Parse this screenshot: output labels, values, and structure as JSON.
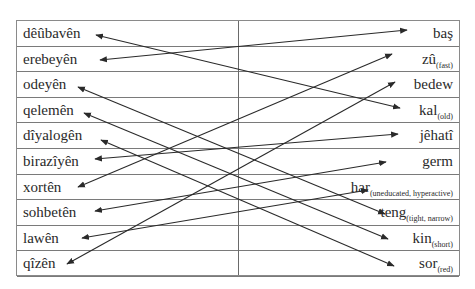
{
  "exercise": {
    "left_column": [
      {
        "word": "dêûbavên"
      },
      {
        "word": "erebeyên"
      },
      {
        "word": "odeyên"
      },
      {
        "word": "qelemên"
      },
      {
        "word": "dîyalogên"
      },
      {
        "word": "birazîyên"
      },
      {
        "word": "xortên"
      },
      {
        "word": "sohbetên"
      },
      {
        "word": "lawên"
      },
      {
        "word": "qîzên"
      }
    ],
    "right_column": [
      {
        "word": "baş",
        "gloss": ""
      },
      {
        "word": "zû",
        "gloss": "(fast)"
      },
      {
        "word": "bedew",
        "gloss": ""
      },
      {
        "word": "kal",
        "gloss": "(old)"
      },
      {
        "word": "jêhatî",
        "gloss": ""
      },
      {
        "word": "germ",
        "gloss": ""
      },
      {
        "word": "har",
        "gloss": "(uneducated, hyperactive)"
      },
      {
        "word": "teng",
        "gloss": "(tight, narrow)"
      },
      {
        "word": "kin",
        "gloss": "(short)"
      },
      {
        "word": "sor",
        "gloss": "(red)"
      }
    ],
    "connections": [
      {
        "left": "dêûbavên",
        "right": "kal"
      },
      {
        "left": "erebeyên",
        "right": "baş"
      },
      {
        "left": "odeyên",
        "right": "teng"
      },
      {
        "left": "qelemên",
        "right": "kin"
      },
      {
        "left": "dîyalogên",
        "right": "sor"
      },
      {
        "left": "birazîyên",
        "right": "jêhatî"
      },
      {
        "left": "xortên",
        "right": "zû"
      },
      {
        "left": "sohbetên",
        "right": "germ"
      },
      {
        "left": "lawên",
        "right": "har"
      },
      {
        "left": "qîzên",
        "right": "bedew"
      }
    ],
    "line_color": "#2a2a2a",
    "border_color": "#7a7a7a"
  }
}
